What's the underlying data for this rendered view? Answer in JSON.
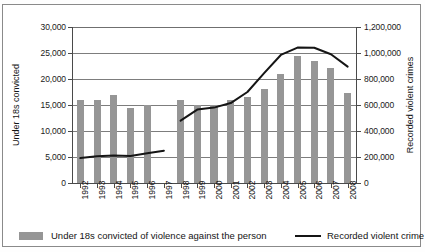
{
  "chart_data": {
    "type": "bar",
    "title": "",
    "subtitle": "",
    "xlabel": "",
    "ylabel": "Under 18s convicted",
    "ylabel_secondary": "Recorded violent crimes",
    "categories": [
      "1992",
      "1993",
      "1994",
      "1995",
      "1996",
      "1997",
      "1998",
      "1999",
      "2000",
      "2001",
      "2002",
      "2003",
      "2004",
      "2005",
      "2006",
      "2007",
      "2008"
    ],
    "grid": true,
    "legend_position": "bottom",
    "ylim": [
      0,
      30000
    ],
    "ylim_secondary": [
      0,
      1200000
    ],
    "yticks": [
      0,
      5000,
      10000,
      15000,
      20000,
      25000,
      30000
    ],
    "yticklabels": [
      "0",
      "5,000",
      "10,000",
      "15,000",
      "20,000",
      "25,000",
      "30,000"
    ],
    "yticks_secondary": [
      0,
      200000,
      400000,
      600000,
      800000,
      1000000,
      1200000
    ],
    "yticklabels_secondary": [
      "0",
      "200,000",
      "400,000",
      "600,000",
      "800,000",
      "1,000,000",
      "1,200,000"
    ],
    "series": [
      {
        "name": "Under 18s convicted of violence against the person",
        "type": "bar",
        "axis": "left",
        "color": "#969696",
        "values": [
          15900,
          16000,
          17000,
          14400,
          15000,
          null,
          15900,
          15000,
          15000,
          15900,
          16600,
          18100,
          20900,
          24400,
          23400,
          22100,
          17400
        ]
      },
      {
        "name": "Recorded violent crime",
        "type": "line",
        "axis": "right",
        "color": "#151515",
        "values": [
          192000,
          205000,
          212000,
          208000,
          228000,
          248000,
          null,
          480000,
          560000,
          582000,
          600000,
          650000,
          790000,
          970000,
          1042000,
          1045000,
          1020000
        ]
      }
    ],
    "line_segments": [
      {
        "name": "Recorded violent crime 1992-1997",
        "x_categories": [
          "1992",
          "1993",
          "1994",
          "1995",
          "1996",
          "1997"
        ],
        "values": [
          192000,
          205000,
          212000,
          208000,
          228000,
          248000
        ]
      },
      {
        "name": "Recorded violent crime 1998-2008",
        "x_categories": [
          "1998",
          "1999",
          "2000",
          "2001",
          "2002",
          "2003",
          "2004",
          "2005",
          "2006",
          "2007",
          "2008"
        ],
        "values": [
          480000,
          565000,
          580000,
          615000,
          700000,
          845000,
          985000,
          1042000,
          1040000,
          990000,
          895000
        ]
      }
    ],
    "annotations": []
  },
  "axes": {
    "left_title": "Under 18s convicted",
    "right_title": "Recorded violent crimes"
  },
  "legend": {
    "bar_label": "Under 18s convicted of violence against the person",
    "line_label": "Recorded violent crime"
  },
  "colors": {
    "bar": "#969696",
    "line": "#151515",
    "grid": "#7d7d7d",
    "axis": "#4a4a4a",
    "text": "#141414",
    "frame": "#8a8a8a",
    "background": "#ffffff"
  }
}
